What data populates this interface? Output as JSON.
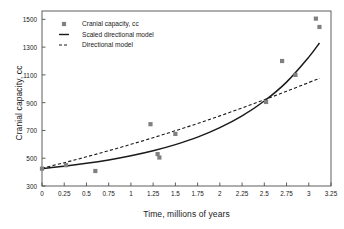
{
  "chart_data": {
    "type": "scatter",
    "title": "",
    "xlabel": "Time, millions of years",
    "ylabel": "Cranial capacity, cc",
    "xlim": [
      0,
      3.25
    ],
    "ylim": [
      300,
      1560
    ],
    "grid": false,
    "legend_position": "upper-left-inside",
    "xticks": [
      0,
      0.25,
      0.5,
      0.75,
      1,
      1.25,
      1.5,
      1.75,
      2,
      2.25,
      2.5,
      2.75,
      3,
      3.25
    ],
    "xticklabels": [
      "0",
      "0.25",
      "0.5",
      "0.75",
      "1",
      "1.25",
      "1.5",
      "1.75",
      "2",
      "2.25",
      "2.5",
      "2.75",
      "3",
      "3.25"
    ],
    "yticks": [
      300,
      500,
      700,
      900,
      1100,
      1300,
      1500
    ],
    "yticklabels": [
      "300",
      "500",
      "700",
      "900",
      "1100",
      "1300",
      "1500"
    ],
    "series": [
      {
        "name": "Cranial capacity, cc",
        "type": "scatter",
        "marker": "square",
        "color": "#808080",
        "points": [
          [
            0.0,
            425
          ],
          [
            0.27,
            450
          ],
          [
            0.6,
            408
          ],
          [
            1.22,
            745
          ],
          [
            1.3,
            530
          ],
          [
            1.32,
            505
          ],
          [
            1.5,
            675
          ],
          [
            2.52,
            905
          ],
          [
            2.7,
            1200
          ],
          [
            2.85,
            1100
          ],
          [
            3.08,
            1505
          ],
          [
            3.12,
            1445
          ]
        ]
      },
      {
        "name": "Scaled directional model",
        "type": "line",
        "style": "solid",
        "color": "#1a1a1a",
        "x": [
          0,
          0.25,
          0.5,
          0.75,
          1,
          1.25,
          1.5,
          1.75,
          2,
          2.25,
          2.5,
          2.75,
          3,
          3.12
        ],
        "y": [
          425,
          442,
          463,
          488,
          518,
          554,
          598,
          652,
          720,
          805,
          912,
          1048,
          1228,
          1330
        ]
      },
      {
        "name": "Directional model",
        "type": "line",
        "style": "dashed",
        "color": "#1a1a1a",
        "x": [
          0,
          0.25,
          0.5,
          0.75,
          1,
          1.25,
          1.5,
          1.75,
          2,
          2.25,
          2.5,
          2.75,
          3,
          3.12
        ],
        "y": [
          428,
          468,
          510,
          554,
          600,
          648,
          698,
          750,
          805,
          862,
          921,
          982,
          1045,
          1075
        ]
      }
    ]
  },
  "legend": {
    "entries": [
      {
        "label": "Cranial capacity, cc",
        "swatch": "square-marker",
        "color": "#808080"
      },
      {
        "label": "Scaled directional model",
        "swatch": "solid-line",
        "color": "#1a1a1a"
      },
      {
        "label": "Directional model",
        "swatch": "dashed-line",
        "color": "#1a1a1a"
      }
    ]
  },
  "colors": {
    "marker": "#808080",
    "line": "#1a1a1a",
    "axis": "#4d4d4d",
    "background": "#ffffff",
    "text": "#1a1a1a"
  }
}
